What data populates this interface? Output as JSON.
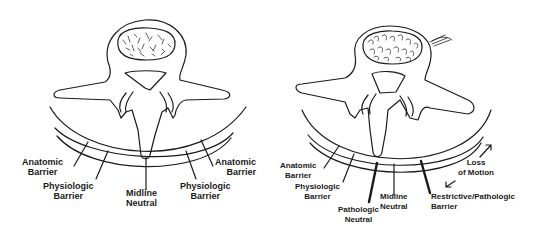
{
  "panels": [
    {
      "id": "normal",
      "labels": {
        "anatomic_left": [
          "Anatomic",
          "Barrier"
        ],
        "physiologic_left": [
          "Physiologic",
          "Barrier"
        ],
        "midline": [
          "Midline",
          "Neutral"
        ],
        "physiologic_right": [
          "Physiologic",
          "Barrier"
        ],
        "anatomic_right": [
          "Anatomic",
          "Barrier"
        ]
      }
    },
    {
      "id": "dysfunction",
      "labels": {
        "anatomic_left": [
          "Anatomic",
          "Barrier"
        ],
        "physiologic_left": [
          "Physiologic",
          "Barrier"
        ],
        "pathologic_neutral": [
          "Pathologic",
          "Neutral"
        ],
        "midline": [
          "Midline",
          "Neutral"
        ],
        "restrictive": [
          "Restrictive/Pathologic",
          "Barrier"
        ],
        "loss_of_motion": [
          "Loss",
          "of Motion"
        ]
      }
    }
  ],
  "colors": {
    "ink": "#1a1a1a",
    "background": "#ffffff"
  }
}
